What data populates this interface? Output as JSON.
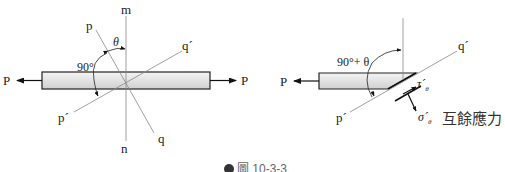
{
  "figure": {
    "caption": "圖 10-3-3",
    "left": {
      "force_left": "P",
      "force_right": "P",
      "m": "m",
      "n": "n",
      "p": "p",
      "q": "q",
      "p_prime": "p´",
      "q_prime": "q´",
      "theta": "θ",
      "angle_90": "90°"
    },
    "right": {
      "force_left": "P",
      "p_prime": "p´",
      "q_prime": "q´",
      "angle": "90°+ θ",
      "tau": "τ´",
      "tau_sub": "θ",
      "sigma": "σ´",
      "sigma_sub": "θ",
      "title": "互餘應力"
    }
  }
}
